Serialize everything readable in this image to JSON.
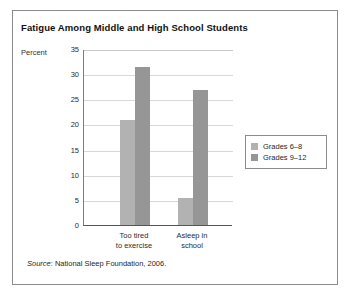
{
  "figure": {
    "title": "Fatigue Among Middle and High School Students",
    "source_word": "Source",
    "source_text": ": National Sleep Foundation, 2006."
  },
  "chart_data": {
    "type": "bar",
    "title": "Fatigue Among Middle and High School Students",
    "xlabel": "",
    "ylabel": "Percent",
    "categories": [
      "Too tired to exercise",
      "Asleep in school"
    ],
    "category_lines": [
      [
        "Too tired",
        "to exercise"
      ],
      [
        "Asleep in",
        "school"
      ]
    ],
    "series": [
      {
        "name": "Grades 6–8",
        "color": "#b2b2b2",
        "values": [
          20.9,
          5.3
        ]
      },
      {
        "name": "Grades 9–12",
        "color": "#969696",
        "values": [
          31.5,
          26.8
        ]
      }
    ],
    "ylim": [
      0,
      35
    ],
    "yticks": [
      0,
      5,
      10,
      15,
      20,
      25,
      30,
      35
    ],
    "ytick_labels": [
      "0",
      "5",
      "10",
      "15",
      "20",
      "25",
      "30",
      "35"
    ],
    "grid": true,
    "legend_position": "right"
  }
}
